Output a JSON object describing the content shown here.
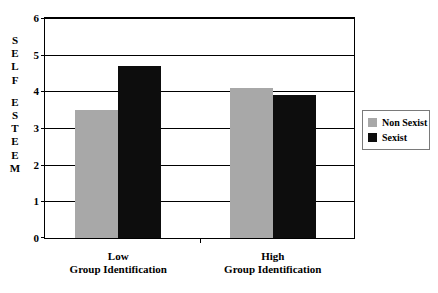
{
  "chart_data": {
    "type": "bar",
    "title": "",
    "xlabel": "",
    "ylabel": "SELF ESTEEM",
    "ylabel_letters": [
      "S",
      "E",
      "L",
      "F",
      "",
      "E",
      "S",
      "T",
      "E",
      "E",
      "M"
    ],
    "categories": [
      "Low\nGroup Identification",
      "High\nGroup Identification"
    ],
    "category_lines": [
      {
        "line1": "Low",
        "line2": "Group Identification"
      },
      {
        "line1": "High",
        "line2": "Group Identification"
      }
    ],
    "series": [
      {
        "name": "Non Sexist",
        "color": "#a8a8a8",
        "values": [
          3.5,
          4.1
        ]
      },
      {
        "name": "Sexist",
        "color": "#0d0d0d",
        "values": [
          4.7,
          3.9
        ]
      }
    ],
    "ylim": [
      0,
      6
    ],
    "ytick_values": [
      0,
      1,
      2,
      3,
      4,
      5,
      6
    ],
    "ytick_labels": [
      "0",
      "1",
      "2",
      "3",
      "4",
      "5",
      "6"
    ],
    "grid": true,
    "grid_axis": "y",
    "legend_position": "right",
    "legend_entries": [
      "Non Sexist",
      "Sexist"
    ]
  }
}
